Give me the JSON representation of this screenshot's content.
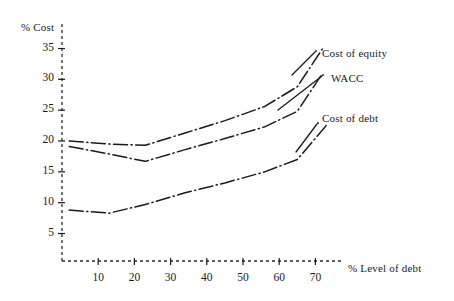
{
  "chart_data": {
    "type": "line",
    "title": "",
    "xlabel": "% Level of debt",
    "ylabel": "% Cost",
    "xlim": [
      0,
      78
    ],
    "ylim": [
      3,
      37
    ],
    "grid": false,
    "legend_position": "inline-right-annotations",
    "xticks": [
      10,
      20,
      30,
      40,
      50,
      60,
      70
    ],
    "yticks": [
      5,
      10,
      15,
      20,
      25,
      30,
      35
    ],
    "line_style": "dash-dot",
    "line_color": "#1a1a1a",
    "series": [
      {
        "name": "Cost of equity",
        "x": [
          2,
          13,
          23,
          34,
          45,
          56,
          65,
          72
        ],
        "values": [
          20.0,
          19.5,
          19.3,
          21.3,
          23.3,
          25.6,
          28.8,
          35.0
        ]
      },
      {
        "name": "WACC",
        "x": [
          2,
          13,
          23,
          34,
          45,
          56,
          65,
          72
        ],
        "values": [
          19.1,
          17.9,
          16.7,
          18.6,
          20.4,
          22.3,
          24.8,
          31.0
        ]
      },
      {
        "name": "Cost of debt",
        "x": [
          2,
          13,
          23,
          34,
          45,
          56,
          65,
          73
        ],
        "values": [
          8.8,
          8.3,
          9.7,
          11.6,
          13.2,
          15.0,
          17.0,
          22.5
        ]
      }
    ],
    "annotations": [
      {
        "text": "Cost of equity",
        "x_px": 322,
        "y_px": 47,
        "leader_from_px": [
          292,
          75
        ],
        "leader_to_px": [
          315,
          52
        ]
      },
      {
        "text": "WACC",
        "x_px": 331,
        "y_px": 72,
        "leader_from_px": [
          278,
          110
        ],
        "leader_to_px": [
          322,
          76
        ]
      },
      {
        "text": "Cost of debt",
        "x_px": 322,
        "y_px": 112,
        "leader_from_px": [
          296,
          152
        ],
        "leader_to_px": [
          317,
          124
        ]
      }
    ]
  },
  "axes": {
    "y_axis_title": "% Cost",
    "x_axis_title": "% Level of debt",
    "y_tick_labels": [
      "35",
      "30",
      "25",
      "20",
      "15",
      "10",
      "5"
    ],
    "x_tick_labels": [
      "10",
      "20",
      "30",
      "40",
      "50",
      "60",
      "70"
    ]
  },
  "colors": {
    "line": "#1a1a1a",
    "axis": "#2a2a2a",
    "text": "#1a1a1a",
    "background": "#ffffff"
  }
}
